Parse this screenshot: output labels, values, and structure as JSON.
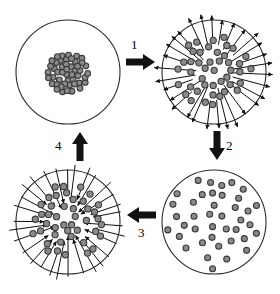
{
  "figure": {
    "title": "",
    "background_color": "#ffffff",
    "width": 280,
    "height": 294,
    "outline_color": "#2b2b2b",
    "particle_fill": "#8a8a8a",
    "particle_stroke": "#3a3a3a",
    "arrow_color": "#111111"
  },
  "panels": [
    {
      "id": "top-left",
      "name": "aggregated-cluster",
      "state_label": "",
      "particle_count": 62,
      "distribution": "dense-central-cluster",
      "motion_arrows": "none",
      "cx": 68,
      "cy": 72,
      "r": 52
    },
    {
      "id": "top-right",
      "name": "dispersing-outward",
      "state_label": "",
      "particle_count": 44,
      "distribution": "clustered-center-spreading",
      "motion_arrows": "radial-outward",
      "cx": 214,
      "cy": 72,
      "r": 52
    },
    {
      "id": "bottom-right",
      "name": "fully-dispersed",
      "state_label": "",
      "particle_count": 40,
      "distribution": "uniform-scattered",
      "motion_arrows": "none",
      "cx": 214,
      "cy": 222,
      "r": 52
    },
    {
      "id": "bottom-left",
      "name": "aggregating-inward",
      "state_label": "",
      "particle_count": 44,
      "distribution": "clustered-center-converging",
      "motion_arrows": "radial-inward",
      "cx": 68,
      "cy": 222,
      "r": 52
    }
  ],
  "arrows": [
    {
      "id": "step-1",
      "label": "1",
      "direction": "right",
      "from": "top-left",
      "to": "top-right",
      "x": 126,
      "y": 60,
      "label_x": 131,
      "label_y": 48
    },
    {
      "id": "step-2",
      "label": "2",
      "direction": "down",
      "from": "top-right",
      "to": "bottom-right",
      "x": 206,
      "y": 132,
      "label_x": 222,
      "label_y": 141
    },
    {
      "id": "step-3",
      "label": "3",
      "direction": "left",
      "from": "bottom-right",
      "to": "bottom-left",
      "x": 126,
      "y": 212,
      "label_x": 141,
      "label_y": 226
    },
    {
      "id": "step-4",
      "label": "4",
      "direction": "up",
      "from": "bottom-left",
      "to": "top-left",
      "x": 72,
      "y": 132,
      "label_x": 58,
      "label_y": 141
    }
  ],
  "chart_data": {
    "type": "diagram",
    "stages": [
      {
        "step": 1,
        "transition": "aggregated cluster to dispersing outward",
        "arrow": "right"
      },
      {
        "step": 2,
        "transition": "dispersing outward to fully dispersed",
        "arrow": "down"
      },
      {
        "step": 3,
        "transition": "fully dispersed to aggregating inward",
        "arrow": "left"
      },
      {
        "step": 4,
        "transition": "aggregating inward to aggregated cluster",
        "arrow": "up"
      }
    ]
  }
}
